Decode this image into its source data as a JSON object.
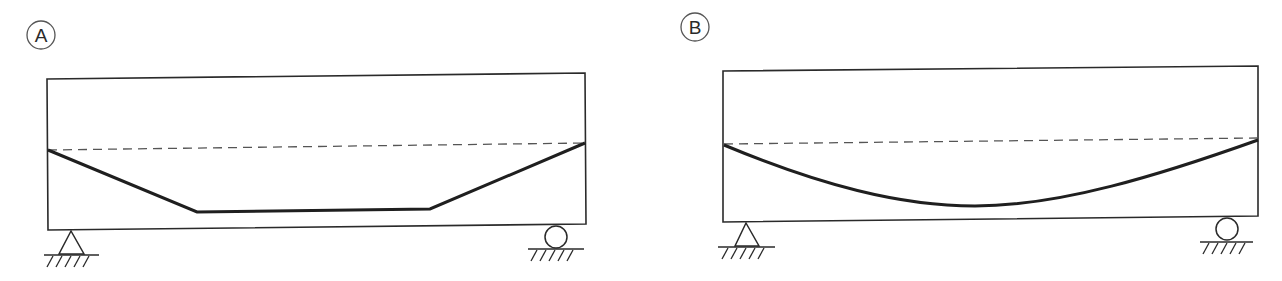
{
  "colors": {
    "stroke": "#2a2a2a",
    "dashed": "#555555",
    "background": "#ffffff"
  },
  "panels": [
    {
      "label": "A",
      "label_circle": {
        "cx": 41,
        "cy": 35,
        "r": 14
      },
      "beam": {
        "x1": 47,
        "y_top_left": 79,
        "x2": 585,
        "y_top_right": 73,
        "y_bottom_left": 230,
        "y_bottom_right": 224
      },
      "reference_line": {
        "style": "dashed",
        "x1": 48,
        "y1": 150,
        "x2": 585,
        "y2": 143
      },
      "profile": {
        "type": "trapezoidal",
        "points": [
          [
            48,
            150
          ],
          [
            197,
            212
          ],
          [
            430,
            209
          ],
          [
            585,
            143
          ]
        ]
      },
      "left_support": {
        "type": "pinned",
        "apex": [
          71,
          231
        ],
        "base_y": 254,
        "base_x1": 59,
        "base_x2": 84,
        "ground_y": 255,
        "ground_x1": 44,
        "ground_x2": 99
      },
      "right_support": {
        "type": "roller",
        "cx": 556,
        "cy": 237,
        "r": 11,
        "ground_y": 249,
        "ground_x1": 528,
        "ground_x2": 584
      }
    },
    {
      "label": "B",
      "label_circle": {
        "cx": 695,
        "cy": 27,
        "r": 14
      },
      "beam": {
        "x1": 723,
        "y_top_left": 71,
        "x2": 1258,
        "y_top_right": 66,
        "y_bottom_left": 222,
        "y_bottom_right": 216
      },
      "reference_line": {
        "style": "dashed",
        "x1": 724,
        "y1": 144,
        "x2": 1258,
        "y2": 138
      },
      "profile": {
        "type": "parabolic",
        "start": [
          724,
          145
        ],
        "bottom": [
          975,
          206
        ],
        "end": [
          1258,
          140
        ]
      },
      "left_support": {
        "type": "pinned",
        "apex": [
          746,
          223
        ],
        "base_y": 246,
        "base_x1": 735,
        "base_x2": 759,
        "ground_y": 247,
        "ground_x1": 718,
        "ground_x2": 775
      },
      "right_support": {
        "type": "roller",
        "cx": 1227,
        "cy": 229,
        "r": 11,
        "ground_y": 242,
        "ground_x1": 1200,
        "ground_x2": 1253
      }
    }
  ]
}
